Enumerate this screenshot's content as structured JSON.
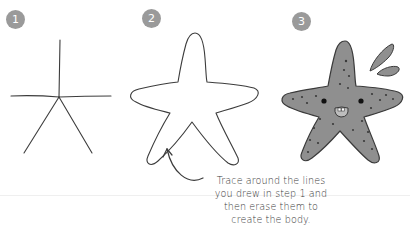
{
  "steps": [
    {
      "number": "1",
      "badge_color": "#9a9a9a",
      "description_icon": "stick-star-lines"
    },
    {
      "number": "2",
      "badge_color": "#9a9a9a",
      "description_icon": "starfish-outline"
    },
    {
      "number": "3",
      "badge_color": "#9a9a9a",
      "description_icon": "finished-starfish-with-face"
    }
  ],
  "caption": {
    "lines": [
      "Trace around the lines",
      "you drew in step 1 and",
      "then erase them to",
      "create the body."
    ]
  },
  "colors": {
    "line": "#3c3c3c",
    "starfish_fill": "#8f8f8f",
    "starfish_dots": "#3a3a3a",
    "badge": "#9a9a9a"
  }
}
